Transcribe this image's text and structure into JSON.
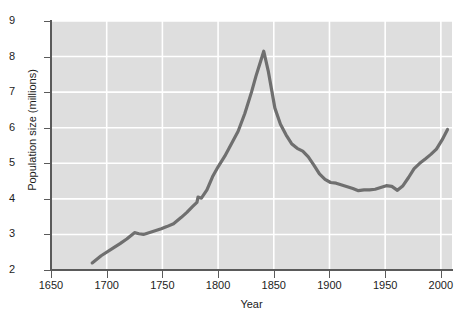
{
  "chart_data": {
    "type": "line",
    "title": "",
    "xlabel": "Year",
    "ylabel": "Population size (millions)",
    "xlim": [
      1650,
      2010
    ],
    "ylim": [
      2,
      9
    ],
    "xticks": [
      1650,
      1700,
      1750,
      1800,
      1850,
      1900,
      1950,
      2000
    ],
    "yticks": [
      2,
      3,
      4,
      5,
      6,
      7,
      8,
      9
    ],
    "grid": true,
    "grid_color": "#ffffff",
    "plot_background": "#dedede",
    "line_color": "#6f6f6f",
    "line_width": 3.2,
    "legend": null,
    "series": [
      {
        "name": "Population size (millions)",
        "x": [
          1687,
          1695,
          1706,
          1712,
          1718,
          1725,
          1729,
          1733,
          1740,
          1749,
          1754,
          1760,
          1767,
          1772,
          1777,
          1781,
          1782,
          1785,
          1790,
          1795,
          1800,
          1806,
          1812,
          1818,
          1824,
          1830,
          1834,
          1837,
          1841,
          1845,
          1851,
          1856,
          1861,
          1866,
          1871,
          1876,
          1881,
          1886,
          1891,
          1896,
          1901,
          1906,
          1911,
          1916,
          1921,
          1926,
          1931,
          1936,
          1941,
          1946,
          1951,
          1956,
          1961,
          1966,
          1971,
          1976,
          1981,
          1986,
          1991,
          1996,
          2001,
          2006
        ],
        "y": [
          2.2,
          2.4,
          2.62,
          2.74,
          2.87,
          3.05,
          3.02,
          3.0,
          3.07,
          3.16,
          3.22,
          3.3,
          3.48,
          3.62,
          3.78,
          3.9,
          4.05,
          4.02,
          4.25,
          4.62,
          4.9,
          5.2,
          5.55,
          5.9,
          6.4,
          7.0,
          7.45,
          7.75,
          8.15,
          7.6,
          6.55,
          6.1,
          5.8,
          5.55,
          5.42,
          5.34,
          5.18,
          4.95,
          4.7,
          4.55,
          4.46,
          4.44,
          4.39,
          4.34,
          4.29,
          4.23,
          4.25,
          4.25,
          4.27,
          4.32,
          4.37,
          4.35,
          4.24,
          4.37,
          4.6,
          4.85,
          5.0,
          5.12,
          5.25,
          5.4,
          5.65,
          5.95
        ]
      }
    ],
    "annotations": []
  },
  "axes": {
    "y_tick_labels": [
      "9",
      "8",
      "7",
      "6",
      "5",
      "4",
      "3",
      "2"
    ],
    "x_tick_labels": [
      "1650",
      "1700",
      "1750",
      "1800",
      "1850",
      "1900",
      "1950",
      "2000"
    ],
    "y_title": "Population size (millions)",
    "x_title": "Year"
  }
}
